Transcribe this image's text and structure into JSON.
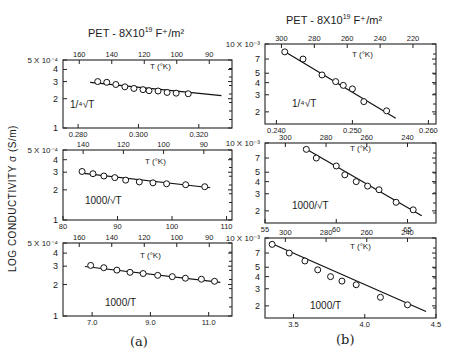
{
  "figure": {
    "ylabel": "LOG  CONDUCTIVITY  σ (S/m)",
    "caption_a": "(a)",
    "caption_b": "(b)",
    "title_a": "PET - 8X10",
    "title_b": "PET - 8X10",
    "title_exp": "19",
    "title_unit": " F⁺/m²"
  },
  "chart_data": [
    {
      "id": "a1",
      "column": "a",
      "type": "scatter",
      "title": "PET - 8X10^19 F+/m^2",
      "xlabel": "1/⁴√T",
      "top_axis_label": "T (°K)",
      "ylabel": "LOG CONDUCTIVITY σ (S/m)",
      "yscale": "log",
      "ylim": [
        0.0001,
        0.0005
      ],
      "ytick_labels": [
        "1",
        "2",
        "3",
        "4",
        "5 X 10⁻⁴"
      ],
      "yticks": [
        1,
        2,
        3,
        4,
        5
      ],
      "xlim": [
        0.275,
        0.331
      ],
      "xticks": [
        0.28,
        0.3,
        0.32
      ],
      "xtick_labels": [
        "0.280",
        "0.300",
        "0.320"
      ],
      "top_ticks": [
        160,
        140,
        120,
        100,
        90
      ],
      "points_x": [
        0.2865,
        0.2895,
        0.2925,
        0.2955,
        0.2985,
        0.3015,
        0.3035,
        0.3065,
        0.3095,
        0.3125,
        0.3165
      ],
      "points_y": [
        3.0,
        2.95,
        2.8,
        2.65,
        2.55,
        2.48,
        2.42,
        2.4,
        2.32,
        2.28,
        2.25
      ],
      "fit": {
        "x": [
          0.284,
          0.3275
        ],
        "y": [
          2.95,
          2.15
        ]
      }
    },
    {
      "id": "a2",
      "column": "a",
      "type": "scatter",
      "xlabel": "1000/√T",
      "top_axis_label": "T (°K)",
      "yscale": "log",
      "ylim": [
        0.0001,
        0.0005
      ],
      "ytick_labels": [
        "1",
        "2",
        "3",
        "4",
        "5 X 10⁻⁴"
      ],
      "yticks": [
        1,
        2,
        3,
        4,
        5
      ],
      "xlim": [
        80,
        111
      ],
      "xticks": [
        80,
        90,
        100,
        110
      ],
      "xtick_labels": [
        "80",
        "90",
        "100",
        "110"
      ],
      "top_ticks": [
        140,
        120,
        100,
        90
      ],
      "points_x": [
        83.5,
        85.5,
        87.5,
        89.5,
        91.5,
        94,
        96.5,
        99,
        102.5,
        106
      ],
      "points_y": [
        3.05,
        2.9,
        2.75,
        2.65,
        2.5,
        2.4,
        2.35,
        2.3,
        2.25,
        2.15
      ],
      "fit": {
        "x": [
          83,
          107
        ],
        "y": [
          2.95,
          2.1
        ]
      }
    },
    {
      "id": "a3",
      "column": "a",
      "type": "scatter",
      "xlabel": "1000/T",
      "top_axis_label": "T (°K)",
      "yscale": "log",
      "ylim": [
        0.0001,
        0.0005
      ],
      "ytick_labels": [
        "1",
        "2",
        "3",
        "4",
        "5 X 10⁻⁴"
      ],
      "yticks": [
        1,
        2,
        3,
        4,
        5
      ],
      "xlim": [
        6.0,
        11.8
      ],
      "xticks": [
        7.0,
        9.0,
        11.0
      ],
      "xtick_labels": [
        "7.0",
        "9.0",
        "11.0"
      ],
      "top_ticks": [
        160,
        140,
        120,
        100,
        90
      ],
      "points_x": [
        6.95,
        7.4,
        7.85,
        8.3,
        8.75,
        9.25,
        9.75,
        10.2,
        10.75,
        11.2
      ],
      "points_y": [
        3.05,
        2.9,
        2.75,
        2.62,
        2.55,
        2.45,
        2.38,
        2.3,
        2.25,
        2.15
      ],
      "fit": {
        "x": [
          6.75,
          11.4
        ],
        "y": [
          2.98,
          2.1
        ]
      }
    },
    {
      "id": "b1",
      "column": "b",
      "type": "scatter",
      "xlabel": "1/⁴√T",
      "top_axis_label": "T (°K)",
      "yscale": "log",
      "ylim": [
        0.0015,
        0.01
      ],
      "ytick_labels": [
        "2",
        "3",
        "4",
        "5",
        "7",
        "10 X 10⁻³"
      ],
      "yticks": [
        2,
        3,
        4,
        5,
        7,
        10
      ],
      "xlim": [
        0.2385,
        0.261
      ],
      "xticks": [
        0.24,
        0.25,
        0.26
      ],
      "xtick_labels": [
        "0.240",
        "0.250",
        "0.260"
      ],
      "top_ticks": [
        300,
        280,
        260,
        240,
        220
      ],
      "points_x": [
        0.2411,
        0.2435,
        0.246,
        0.2478,
        0.2488,
        0.25,
        0.2515,
        0.2545
      ],
      "points_y": [
        8.3,
        7.0,
        4.8,
        4.1,
        3.75,
        3.45,
        2.55,
        2.05
      ],
      "fit": {
        "x": [
          0.2408,
          0.2557
        ],
        "y": [
          8.6,
          1.72
        ]
      }
    },
    {
      "id": "b2",
      "column": "b",
      "type": "scatter",
      "xlabel": "1000/√T",
      "top_axis_label": "T (°K)",
      "yscale": "log",
      "ylim": [
        0.0015,
        0.01
      ],
      "ytick_labels": [
        "2",
        "3",
        "4",
        "5",
        "7",
        "10 X 10⁻³"
      ],
      "yticks": [
        2,
        3,
        4,
        5,
        7,
        10
      ],
      "xlim": [
        55,
        67
      ],
      "xticks": [
        55,
        60,
        65
      ],
      "xtick_labels": [
        "55",
        "60",
        "65"
      ],
      "top_ticks": [
        300,
        280,
        260,
        240
      ],
      "points_x": [
        57.9,
        58.6,
        60.0,
        60.6,
        61.4,
        62.2,
        63.0,
        64.2,
        65.4
      ],
      "points_y": [
        8.6,
        7.0,
        5.8,
        4.7,
        4.0,
        3.6,
        3.3,
        2.45,
        2.05
      ],
      "fit": {
        "x": [
          57.7,
          66.0
        ],
        "y": [
          9.0,
          1.78
        ]
      }
    },
    {
      "id": "b3",
      "column": "b",
      "type": "scatter",
      "xlabel": "1000/T",
      "top_axis_label": "T (°K)",
      "yscale": "log",
      "ylim": [
        0.0015,
        0.01
      ],
      "ytick_labels": [
        "2",
        "3",
        "4",
        "5",
        "7",
        "10 X 10⁻³"
      ],
      "yticks": [
        2,
        3,
        4,
        5,
        7,
        10
      ],
      "xlim": [
        3.3,
        4.5
      ],
      "xticks": [
        3.5,
        4.0,
        4.5
      ],
      "xtick_labels": [
        "3.5",
        "4.0",
        "4.5"
      ],
      "top_ticks": [
        300,
        280,
        260,
        240
      ],
      "points_x": [
        3.35,
        3.47,
        3.58,
        3.67,
        3.76,
        3.84,
        3.94,
        4.11,
        4.3
      ],
      "points_y": [
        8.6,
        7.0,
        5.8,
        4.7,
        4.0,
        3.6,
        3.3,
        2.45,
        2.05
      ],
      "fit": {
        "x": [
          3.33,
          4.43
        ],
        "y": [
          9.0,
          1.75
        ]
      }
    }
  ],
  "panels": [
    {
      "frame": [
        63,
        60,
        232,
        128
      ],
      "xlabel_pos": [
        70,
        108
      ],
      "tlabel_pos": [
        150,
        69
      ]
    },
    {
      "frame": [
        63,
        150,
        232,
        220
      ],
      "xlabel_pos": [
        85,
        204
      ],
      "tlabel_pos": [
        145,
        164
      ]
    },
    {
      "frame": [
        63,
        243,
        232,
        316
      ],
      "xlabel_pos": [
        105,
        306
      ],
      "tlabel_pos": [
        140,
        258
      ]
    },
    {
      "frame": [
        265,
        44,
        436,
        124
      ],
      "xlabel_pos": [
        292,
        107
      ],
      "tlabel_pos": [
        352,
        57
      ]
    },
    {
      "frame": [
        265,
        143,
        436,
        223
      ],
      "xlabel_pos": [
        292,
        209
      ],
      "tlabel_pos": [
        350,
        151
      ]
    },
    {
      "frame": [
        265,
        238,
        436,
        318
      ],
      "xlabel_pos": [
        310,
        309
      ],
      "tlabel_pos": [
        350,
        249
      ]
    }
  ]
}
